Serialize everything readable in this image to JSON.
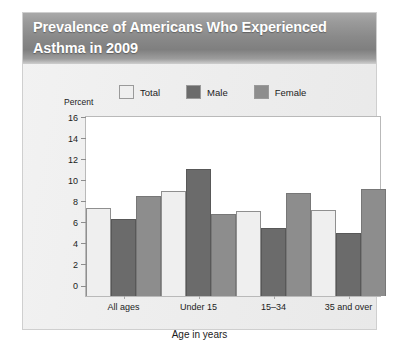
{
  "title": "Prevalence of Americans Who Experienced Asthma in 2009",
  "legend": [
    {
      "label": "Total",
      "color": "#efefef"
    },
    {
      "label": "Male",
      "color": "#6b6b6b"
    },
    {
      "label": "Female",
      "color": "#8d8d8d"
    }
  ],
  "chart_data": {
    "type": "bar",
    "title": "Prevalence of Americans Who Experienced Asthma in 2009",
    "subtitle": "",
    "xlabel": "Age in years",
    "ylabel": "Percent",
    "categories": [
      "All ages",
      "Under 15",
      "15–34",
      "35 and over"
    ],
    "series": [
      {
        "name": "Total",
        "color": "#efefef",
        "values": [
          8.4,
          10.0,
          8.1,
          8.2
        ]
      },
      {
        "name": "Male",
        "color": "#6b6b6b",
        "values": [
          7.3,
          12.1,
          6.5,
          6.0
        ]
      },
      {
        "name": "Female",
        "color": "#8d8d8d",
        "values": [
          9.5,
          7.8,
          9.8,
          10.2
        ]
      }
    ],
    "ylim": [
      0,
      17
    ],
    "yticks": [
      0,
      2,
      4,
      6,
      8,
      10,
      12,
      14,
      16
    ],
    "ytick_labels": [
      "0",
      "2",
      "4",
      "6",
      "8",
      "10",
      "12",
      "14",
      "16"
    ],
    "grid": false,
    "legend_position": "top"
  }
}
